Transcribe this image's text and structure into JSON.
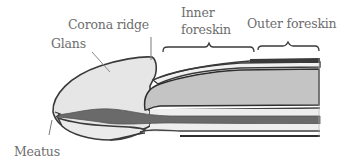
{
  "diagram": {
    "labels": {
      "corona_ridge": "Corona ridge",
      "glans": "Glans",
      "inner_foreskin_line1": "Inner",
      "inner_foreskin_line2": "foreskin",
      "outer_foreskin": "Outer foreskin",
      "meatus": "Meatus"
    },
    "colors": {
      "background": "#ffffff",
      "outline": "#3a3a3a",
      "glans_fill": "#e6e6e6",
      "shaft_fill": "#c4c4c4",
      "skin_fill": "#eeeeee",
      "urethra_fill": "#6a6a6a",
      "label_text": "#6e6e6e",
      "leader_line": "#7a7a7a"
    }
  }
}
